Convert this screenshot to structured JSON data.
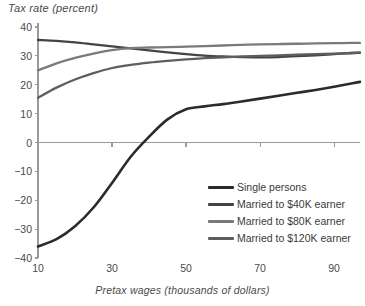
{
  "chart_data": {
    "type": "line",
    "title": "",
    "ylabel": "Tax rate (percent)",
    "xlabel": "Pretax wages (thousands of dollars)",
    "xlim": [
      10,
      97
    ],
    "ylim": [
      -40,
      40
    ],
    "xticks": [
      10,
      30,
      50,
      70,
      90
    ],
    "yticks": [
      40,
      30,
      20,
      10,
      0,
      -10,
      -20,
      -30,
      -40
    ],
    "grid": false,
    "zero_line": true,
    "legend_position": "bottom-right",
    "x": [
      10,
      15,
      20,
      25,
      30,
      35,
      40,
      45,
      50,
      55,
      60,
      65,
      70,
      75,
      80,
      85,
      90,
      95,
      97
    ],
    "series": [
      {
        "name": "Single persons",
        "color": "#2b2b2b",
        "values": [
          -36.0,
          -33.5,
          -29.0,
          -22.5,
          -14.0,
          -5.0,
          2.0,
          8.0,
          11.5,
          12.5,
          13.3,
          14.2,
          15.2,
          16.2,
          17.2,
          18.2,
          19.3,
          20.5,
          21.0
        ]
      },
      {
        "name": "Married to $40K earner",
        "color": "#444444",
        "values": [
          35.5,
          35.2,
          34.7,
          34.0,
          33.3,
          32.6,
          31.9,
          31.2,
          30.6,
          30.1,
          29.8,
          29.6,
          29.5,
          29.6,
          29.9,
          30.2,
          30.6,
          31.0,
          31.1
        ]
      },
      {
        "name": "Married to $80K earner",
        "color": "#7a7a7a",
        "values": [
          25.0,
          27.4,
          29.3,
          30.8,
          32.0,
          32.7,
          32.9,
          33.0,
          33.2,
          33.4,
          33.6,
          33.8,
          34.0,
          34.1,
          34.2,
          34.3,
          34.4,
          34.5,
          34.5
        ]
      },
      {
        "name": "Married to $120K earner",
        "color": "#5e5e5e",
        "values": [
          15.5,
          19.0,
          21.8,
          24.0,
          25.8,
          26.9,
          27.7,
          28.3,
          28.8,
          29.2,
          29.5,
          29.8,
          30.0,
          30.2,
          30.4,
          30.6,
          30.8,
          31.0,
          31.1
        ]
      }
    ],
    "legend": [
      {
        "label": "Single persons",
        "color": "#2b2b2b"
      },
      {
        "label": "Married to $40K earner",
        "color": "#444444"
      },
      {
        "label": "Married to $80K earner",
        "color": "#7a7a7a"
      },
      {
        "label": "Married to $120K earner",
        "color": "#5e5e5e"
      }
    ],
    "axis_color": "#9a9a9a"
  }
}
